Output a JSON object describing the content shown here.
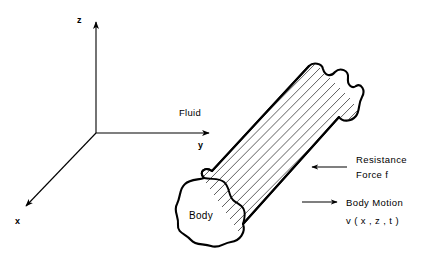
{
  "figure": {
    "background_color": "#ffffff",
    "ink_color": "#000000",
    "width": 422,
    "height": 263
  },
  "axes": {
    "origin_label": "",
    "z_label": "z",
    "y_label": "y",
    "x_label": "x",
    "z_axis_name": "vertical-axis",
    "y_axis_name": "horizontal-axis",
    "x_axis_name": "depth-axis"
  },
  "labels": {
    "fluid": "Fluid",
    "body": "Body"
  },
  "annotations": [
    {
      "id": "resistance-force",
      "line1": "Resistance",
      "line2": "Force f",
      "arrow_direction": "left",
      "arrow_icon": "arrow-left-icon"
    },
    {
      "id": "body-motion",
      "line1": "Body  Motion",
      "line2": "v ( x , z , t )",
      "arrow_direction": "right",
      "arrow_icon": "arrow-right-icon"
    }
  ]
}
